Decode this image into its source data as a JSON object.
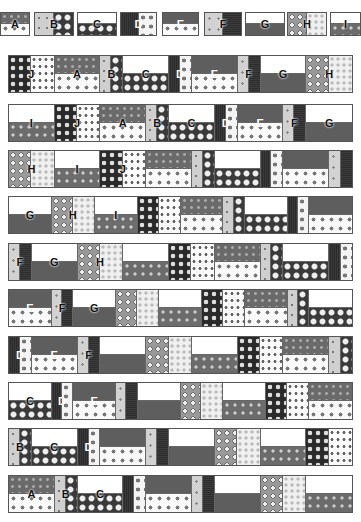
{
  "key_blocks": [
    {
      "label": "A",
      "x": 0,
      "w": 30
    },
    {
      "label": "B",
      "x": 34,
      "w": 40
    },
    {
      "label": "C",
      "x": 77,
      "w": 40
    },
    {
      "label": "D",
      "x": 120,
      "w": 37
    },
    {
      "label": "E",
      "x": 162,
      "w": 37
    },
    {
      "label": "F",
      "x": 204,
      "w": 38
    },
    {
      "label": "G",
      "x": 245,
      "w": 40
    },
    {
      "label": "H",
      "x": 287,
      "w": 40
    },
    {
      "label": "I",
      "x": 330,
      "w": 31
    }
  ],
  "rows": [
    {
      "y": 55,
      "blocks": [
        "J",
        "A",
        "B",
        "C",
        "D",
        "E",
        "F",
        "G",
        "H"
      ],
      "labels": [
        "J",
        "A",
        "B",
        "C",
        "D",
        "E",
        "F",
        "G",
        "H"
      ]
    },
    {
      "y": 104,
      "blocks": [
        "I",
        "J",
        "A",
        "B",
        "C",
        "D",
        "E",
        "F",
        "G"
      ],
      "labels": [
        "I",
        "J",
        "A",
        "B",
        "C",
        "D",
        "E",
        "F",
        "G"
      ]
    },
    {
      "y": 150,
      "blocks": [
        "H",
        "I",
        "J",
        "A",
        "B",
        "C",
        "D",
        "E",
        "F"
      ],
      "labels": [
        "H",
        "I",
        "J",
        "",
        "",
        "",
        "",
        "",
        ""
      ]
    },
    {
      "y": 196,
      "blocks": [
        "G",
        "H",
        "I",
        "J",
        "A",
        "B",
        "C",
        "D",
        "E"
      ],
      "labels": [
        "G",
        "H",
        "I",
        "",
        "",
        "",
        "",
        "",
        ""
      ]
    },
    {
      "y": 243,
      "blocks": [
        "F",
        "G",
        "H",
        "I",
        "J",
        "A",
        "B",
        "C",
        "D"
      ],
      "labels": [
        "F",
        "G",
        "H",
        "",
        "",
        "",
        "",
        "",
        ""
      ]
    },
    {
      "y": 289,
      "blocks": [
        "E",
        "F",
        "G",
        "H",
        "I",
        "J",
        "A",
        "B",
        "C"
      ],
      "labels": [
        "E",
        "F",
        "G",
        "",
        "",
        "",
        "",
        "",
        ""
      ]
    },
    {
      "y": 336,
      "blocks": [
        "D",
        "E",
        "F",
        "G",
        "H",
        "I",
        "J",
        "A",
        "B"
      ],
      "labels": [
        "D",
        "E",
        "F",
        "",
        "",
        "",
        "",
        "",
        ""
      ]
    },
    {
      "y": 382,
      "blocks": [
        "C",
        "D",
        "E",
        "F",
        "G",
        "H",
        "I",
        "J",
        "A"
      ],
      "labels": [
        "C",
        "D",
        "E",
        "",
        "",
        "",
        "",
        "",
        ""
      ]
    },
    {
      "y": 428,
      "blocks": [
        "B",
        "C",
        "D",
        "E",
        "F",
        "G",
        "H",
        "I",
        "J"
      ],
      "labels": [
        "B",
        "C",
        "D",
        "",
        "",
        "",
        "",
        "",
        ""
      ]
    },
    {
      "y": 475,
      "blocks": [
        "A",
        "B",
        "C",
        "D",
        "E",
        "F",
        "G",
        "H",
        "I"
      ],
      "labels": [
        "A",
        "B",
        "C",
        "",
        "",
        "",
        "",
        "",
        ""
      ]
    }
  ],
  "block_widths": {
    "A": 38,
    "B": 19,
    "C": 38,
    "D": 19,
    "E": 38,
    "F": 19,
    "G": 38,
    "H": 38,
    "I": 38,
    "J": 38
  }
}
